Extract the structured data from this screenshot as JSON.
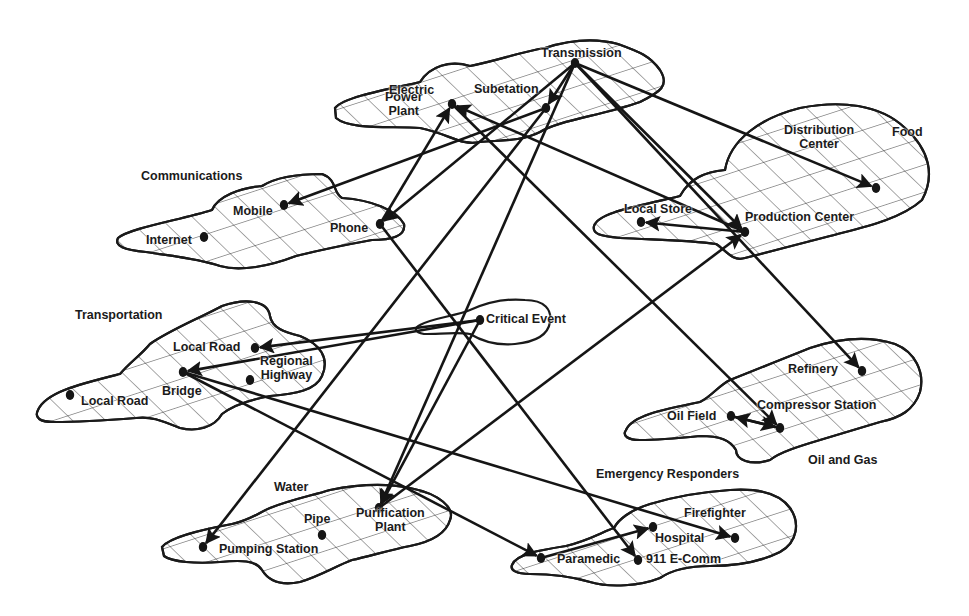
{
  "diagram": {
    "colors": {
      "ink": "#151515",
      "background": "#ffffff"
    },
    "sectors": [
      {
        "id": "electric",
        "label": "Electric",
        "label_pos": [
          389,
          91
        ]
      },
      {
        "id": "communications",
        "label": "Communications",
        "label_pos": [
          141,
          177
        ]
      },
      {
        "id": "food",
        "label": "Food",
        "label_pos": [
          892,
          133
        ]
      },
      {
        "id": "transportation",
        "label": "Transportation",
        "label_pos": [
          75,
          316
        ]
      },
      {
        "id": "critical-event",
        "label": "",
        "label_pos": [
          0,
          0
        ]
      },
      {
        "id": "oil-gas",
        "label": "Oil and Gas",
        "label_pos": [
          808,
          461
        ]
      },
      {
        "id": "water",
        "label": "Water",
        "label_pos": [
          274,
          488
        ]
      },
      {
        "id": "emergency",
        "label": "Emergency Responders",
        "label_pos": [
          596,
          475
        ]
      }
    ],
    "nodes": [
      {
        "id": "transmission",
        "label": "Transmission",
        "x": 575,
        "y": 63,
        "lx": 541,
        "ly": 54,
        "align": "left"
      },
      {
        "id": "substation",
        "label": "Subetation",
        "x": 546,
        "y": 108,
        "lx": 474,
        "ly": 90,
        "align": "left"
      },
      {
        "id": "power-plant",
        "label": "Power Plant",
        "x": 452,
        "y": 104,
        "lx": 385,
        "ly": 104,
        "align": "center2",
        "line1": "Power",
        "line2": "Plant"
      },
      {
        "id": "mobile",
        "label": "Mobile",
        "x": 284,
        "y": 205,
        "lx": 233,
        "ly": 212,
        "align": "left"
      },
      {
        "id": "internet",
        "label": "Internet",
        "x": 204,
        "y": 237,
        "lx": 146,
        "ly": 241,
        "align": "left"
      },
      {
        "id": "phone",
        "label": "Phone",
        "x": 380,
        "y": 224,
        "lx": 330,
        "ly": 229,
        "align": "left"
      },
      {
        "id": "distribution-center",
        "label": "Distribution Center",
        "x": 876,
        "y": 188,
        "lx": 784,
        "ly": 137,
        "align": "center2",
        "line1": "Distribution",
        "line2": "Center"
      },
      {
        "id": "local-store",
        "label": "Local Store",
        "x": 641,
        "y": 222,
        "lx": 624,
        "ly": 210,
        "align": "left"
      },
      {
        "id": "production-center",
        "label": "Production Center",
        "x": 745,
        "y": 232,
        "lx": 745,
        "ly": 218,
        "align": "left"
      },
      {
        "id": "local-road-1",
        "label": "Local Road",
        "x": 255,
        "y": 348,
        "lx": 173,
        "ly": 348,
        "align": "left"
      },
      {
        "id": "bridge",
        "label": "Bridge",
        "x": 183,
        "y": 372,
        "lx": 162,
        "ly": 392,
        "align": "left"
      },
      {
        "id": "regional-highway",
        "label": "Regional Highway",
        "x": 250,
        "y": 380,
        "lx": 260,
        "ly": 368,
        "align": "center2",
        "line1": "Regional",
        "line2": "Highway"
      },
      {
        "id": "local-road-2",
        "label": "Local Road",
        "x": 70,
        "y": 395,
        "lx": 81,
        "ly": 402,
        "align": "left"
      },
      {
        "id": "critical-event",
        "label": "Critical Event",
        "x": 480,
        "y": 320,
        "lx": 486,
        "ly": 320,
        "align": "left"
      },
      {
        "id": "refinery",
        "label": "Refinery",
        "x": 862,
        "y": 371,
        "lx": 788,
        "ly": 370,
        "align": "left"
      },
      {
        "id": "oil-field",
        "label": "Oil Field",
        "x": 731,
        "y": 416,
        "lx": 667,
        "ly": 417,
        "align": "left"
      },
      {
        "id": "compressor-station",
        "label": "Compressor Station",
        "x": 780,
        "y": 428,
        "lx": 757,
        "ly": 406,
        "align": "left"
      },
      {
        "id": "pumping-station",
        "label": "Pumping Station",
        "x": 203,
        "y": 547,
        "lx": 219,
        "ly": 550,
        "align": "left"
      },
      {
        "id": "pipe",
        "label": "Pipe",
        "x": 322,
        "y": 535,
        "lx": 304,
        "ly": 520,
        "align": "left"
      },
      {
        "id": "purification-plant",
        "label": "Purification Plant",
        "x": 379,
        "y": 508,
        "lx": 356,
        "ly": 520,
        "align": "center2",
        "line1": "Purification",
        "line2": "Plant"
      },
      {
        "id": "paramedic",
        "label": "Paramedic",
        "x": 541,
        "y": 558,
        "lx": 557,
        "ly": 560,
        "align": "left"
      },
      {
        "id": "hospital",
        "label": "Hospital",
        "x": 653,
        "y": 527,
        "lx": 655,
        "ly": 539,
        "align": "left"
      },
      {
        "id": "911-ecomm",
        "label": "911 E-Comm",
        "x": 638,
        "y": 560,
        "lx": 646,
        "ly": 560,
        "align": "left"
      },
      {
        "id": "firefighter",
        "label": "Firefighter",
        "x": 735,
        "y": 538,
        "lx": 684,
        "ly": 514,
        "align": "left"
      }
    ],
    "edges": [
      {
        "from": "transmission",
        "to": "substation"
      },
      {
        "from": "transmission",
        "to": "distribution-center"
      },
      {
        "from": "transmission",
        "to": "refinery"
      },
      {
        "from": "transmission",
        "to": "production-center"
      },
      {
        "from": "transmission",
        "to": "purification-plant"
      },
      {
        "from": "transmission",
        "to": "phone"
      },
      {
        "from": "substation",
        "to": "mobile"
      },
      {
        "from": "substation",
        "to": "pumping-station"
      },
      {
        "from": "production-center",
        "to": "power-plant"
      },
      {
        "from": "power-plant",
        "to": "compressor-station"
      },
      {
        "from": "phone",
        "to": "power-plant"
      },
      {
        "from": "phone",
        "to": "911-ecomm"
      },
      {
        "from": "production-center",
        "to": "local-store"
      },
      {
        "from": "purification-plant",
        "to": "production-center"
      },
      {
        "from": "critical-event",
        "to": "local-road-1"
      },
      {
        "from": "critical-event",
        "to": "bridge"
      },
      {
        "from": "critical-event",
        "to": "purification-plant"
      },
      {
        "from": "bridge",
        "to": "paramedic"
      },
      {
        "from": "bridge",
        "to": "firefighter"
      },
      {
        "from": "paramedic",
        "to": "hospital"
      },
      {
        "from": "compressor-station",
        "to": "oil-field"
      },
      {
        "from": "oil-field",
        "to": "compressor-station"
      }
    ],
    "nodes_without_dots": [],
    "blobs": [
      {
        "id": "electric",
        "path": "M335,108 C345,96 395,88 420,82 C430,66 450,60 470,66 C500,60 520,52 545,48 C570,40 595,38 618,44 C640,52 650,56 660,70 C670,86 660,92 640,102 C600,116 560,120 540,132 C520,142 500,140 480,142 C460,146 450,134 420,128 C390,126 350,130 336,118 Z"
      },
      {
        "id": "communications",
        "path": "M118,238 C130,228 180,220 212,210 C218,196 240,188 262,186 C278,176 300,174 322,174 C338,180 332,192 342,198 C372,200 396,210 404,224 C406,236 392,240 372,240 C350,244 320,250 296,256 C270,266 240,272 220,266 C196,258 170,256 146,252 C124,250 114,246 118,238 Z"
      },
      {
        "id": "food",
        "path": "M594,226 C598,212 640,206 680,196 C690,178 705,172 725,170 C730,140 760,118 800,108 C840,100 880,104 905,128 C930,150 935,176 922,200 C900,220 860,228 830,236 C800,244 775,250 745,258 C732,262 726,250 716,244 C690,240 660,240 620,238 C600,236 592,234 594,226 Z"
      },
      {
        "id": "transportation",
        "path": "M38,410 C46,392 80,384 120,374 C130,362 140,356 150,344 C170,330 200,318 222,306 C245,298 268,300 270,316 C272,328 284,332 300,336 C320,344 330,358 322,376 C316,390 296,394 270,396 C248,400 232,406 222,414 C214,428 196,432 180,428 C160,420 150,416 136,418 C110,420 80,422 54,422 C40,422 34,418 38,410 Z"
      },
      {
        "id": "critical-event",
        "path": "M420,325 C432,318 456,316 470,310 C488,302 505,298 525,300 C545,300 552,310 550,322 C548,336 535,342 515,344 C495,346 480,340 470,334 C458,332 440,334 424,334 C414,332 414,328 420,325 Z"
      },
      {
        "id": "oil-gas",
        "path": "M626,430 C632,416 660,410 700,402 C712,396 718,386 730,380 C760,368 780,360 810,348 C840,338 870,336 895,344 C915,352 925,372 920,392 C914,410 900,418 880,422 C860,428 840,434 820,440 C800,446 780,452 770,460 C750,466 736,460 736,450 C730,440 720,436 700,436 C680,438 660,440 640,440 C628,440 622,436 626,430 Z"
      },
      {
        "id": "water",
        "path": "M162,547 C170,537 200,530 232,524 C250,520 260,512 270,508 C290,500 310,496 330,490 C350,486 380,482 410,488 C440,494 455,508 450,520 C446,534 430,542 410,546 C390,550 370,556 352,560 C336,566 320,576 300,582 C280,586 268,580 262,570 C256,560 240,560 220,562 C196,564 172,562 164,556 Z"
      },
      {
        "id": "emergency",
        "path": "M512,565 C516,554 540,550 566,546 C590,540 602,532 614,528 C618,520 630,510 650,504 C670,498 700,492 730,490 C760,488 780,494 790,508 C800,522 798,542 780,552 C760,562 735,566 710,566 C690,566 672,570 660,578 C640,586 610,588 590,582 C570,576 550,574 530,574 C516,574 510,570 512,565 Z"
      }
    ]
  }
}
